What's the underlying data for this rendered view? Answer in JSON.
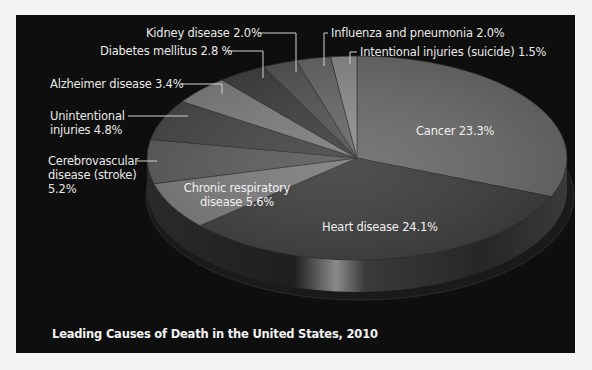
{
  "chart_data": {
    "type": "pie",
    "style": "3d",
    "title": "Leading Causes of Death in the United States, 2010",
    "unit": "%",
    "slices": [
      {
        "name": "Cancer",
        "value": 23.3,
        "label": "Cancer 23.3%",
        "color": "#6b6b6b"
      },
      {
        "name": "Heart disease",
        "value": 24.1,
        "label": "Heart disease 24.1%",
        "color": "#3c3c3c"
      },
      {
        "name": "Chronic respiratory disease",
        "value": 5.6,
        "label": "Chronic respiratory disease 5.6%",
        "color": "#7a7a7a"
      },
      {
        "name": "Cerebrovascular disease (stroke)",
        "value": 5.2,
        "label": "Cerebrovascular disease (stroke) 5.2%",
        "color": "#5a5a5a"
      },
      {
        "name": "Unintentional injuries",
        "value": 4.8,
        "label": "Unintentional injuries 4.8%",
        "color": "#454545"
      },
      {
        "name": "Alzheimer disease",
        "value": 3.4,
        "label": "Alzheimer disease 3.4%",
        "color": "#7d7d7d"
      },
      {
        "name": "Diabetes mellitus",
        "value": 2.8,
        "label": "Diabetes mellitus 2.8 %",
        "color": "#3e3e3e"
      },
      {
        "name": "Kidney disease",
        "value": 2.0,
        "label": "Kidney disease 2.0%",
        "color": "#545454"
      },
      {
        "name": "Influenza and pneumonia",
        "value": 2.0,
        "label": "Influenza and pneumonia 2.0%",
        "color": "#686868"
      },
      {
        "name": "Intentional injuries (suicide)",
        "value": 1.5,
        "label": "Intentional injuries (suicide) 1.5%",
        "color": "#8e8e8e"
      }
    ],
    "start_angle_deg": 0,
    "direction": "clockwise",
    "legend": "none (direct labels with leader lines)"
  },
  "labels": {
    "cancer": "Cancer 23.3%",
    "heart": "Heart disease 24.1%",
    "chronic_line1": "Chronic respiratory",
    "chronic_line2": "disease 5.6%",
    "cerebro_line1": "Cerebrovascular",
    "cerebro_line2": "disease (stroke)",
    "cerebro_line3": "5.2%",
    "unintentional_line1": "Unintentional",
    "unintentional_line2": "injuries 4.8%",
    "alzheimer": "Alzheimer disease 3.4%",
    "diabetes": "Diabetes mellitus 2.8 %",
    "kidney": "Kidney disease 2.0%",
    "influenza": "Influenza and pneumonia 2.0%",
    "intentional": "Intentional injuries (suicide) 1.5%"
  },
  "title": "Leading Causes of Death in the United States, 2010",
  "colors": {
    "page_bg": "#f4f4f2",
    "panel_bg": "#0e0e0e",
    "text": "#e8e8e8",
    "leader": "#d0d0d0"
  }
}
